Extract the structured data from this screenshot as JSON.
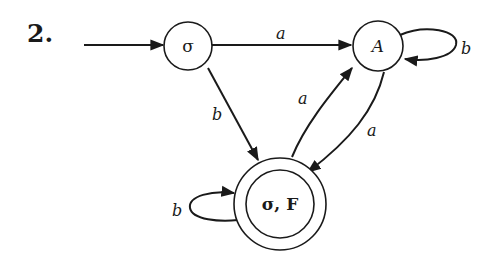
{
  "problem": {
    "number": "2."
  },
  "diagram": {
    "type": "finite-automaton",
    "states": [
      {
        "id": "sigma",
        "label": "σ",
        "start": true,
        "accepting": false
      },
      {
        "id": "A",
        "label": "A",
        "start": false,
        "accepting": false
      },
      {
        "id": "sigmaF",
        "label": "σ, F",
        "start": false,
        "accepting": true
      }
    ],
    "transitions": [
      {
        "from": "sigma",
        "to": "A",
        "label": "a"
      },
      {
        "from": "sigma",
        "to": "sigmaF",
        "label": "b"
      },
      {
        "from": "A",
        "to": "A",
        "label": "b"
      },
      {
        "from": "A",
        "to": "sigmaF",
        "label": "a"
      },
      {
        "from": "sigmaF",
        "to": "A",
        "label": "a"
      },
      {
        "from": "sigmaF",
        "to": "sigmaF",
        "label": "b"
      }
    ],
    "colors": {
      "stroke": "#1a1a1a",
      "background": "#ffffff"
    }
  }
}
